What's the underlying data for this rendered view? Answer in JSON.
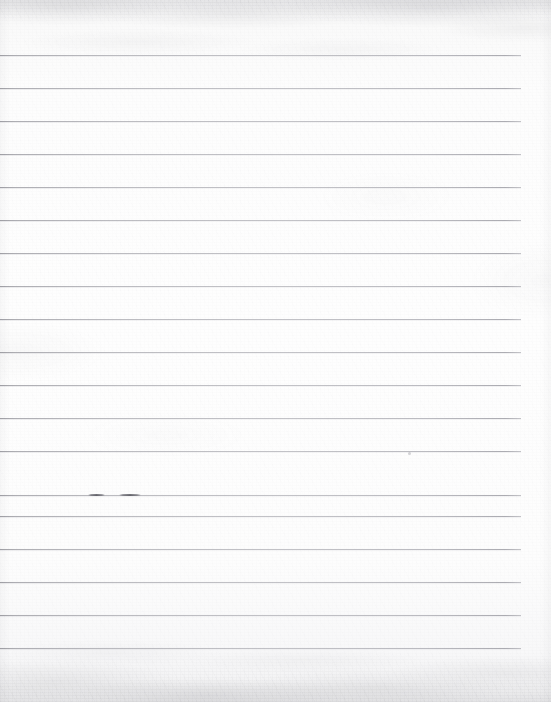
{
  "document": {
    "type": "scanned-ruled-notebook-page",
    "description": "Blank lined notebook paper, scanned",
    "content_text": "",
    "width": 551,
    "height": 702
  },
  "paper": {
    "background_color": "#fcfcfc",
    "edge_tint_color": "#f0f0f1",
    "texture": "scan-noise-mottled"
  },
  "ruling": {
    "line_color": "#a9a9ad",
    "line_thickness_px": 1,
    "line_spacing_px": 33,
    "first_line_y": 55,
    "line_start_x": 0,
    "line_end_x": 521,
    "right_margin_px": 30,
    "line_count": 19,
    "line_y_positions": [
      55,
      88,
      121,
      154,
      187,
      220,
      253,
      286,
      319,
      352,
      385,
      418,
      451,
      484,
      495,
      516,
      549,
      582,
      615,
      648
    ]
  },
  "rules": [
    {
      "y": 55,
      "x1": 0,
      "x2": 521
    },
    {
      "y": 88,
      "x1": 0,
      "x2": 521
    },
    {
      "y": 121,
      "x1": 0,
      "x2": 521
    },
    {
      "y": 154,
      "x1": 0,
      "x2": 521
    },
    {
      "y": 187,
      "x1": 0,
      "x2": 521
    },
    {
      "y": 220,
      "x1": 0,
      "x2": 521
    },
    {
      "y": 253,
      "x1": 0,
      "x2": 521
    },
    {
      "y": 286,
      "x1": 0,
      "x2": 521
    },
    {
      "y": 319,
      "x1": 0,
      "x2": 521
    },
    {
      "y": 352,
      "x1": 0,
      "x2": 521
    },
    {
      "y": 385,
      "x1": 0,
      "x2": 521
    },
    {
      "y": 418,
      "x1": 0,
      "x2": 521
    },
    {
      "y": 451,
      "x1": 0,
      "x2": 521
    },
    {
      "y": 495,
      "x1": 0,
      "x2": 521
    },
    {
      "y": 516,
      "x1": 0,
      "x2": 521
    },
    {
      "y": 549,
      "x1": 0,
      "x2": 521
    },
    {
      "y": 582,
      "x1": 0,
      "x2": 521
    },
    {
      "y": 615,
      "x1": 0,
      "x2": 521
    },
    {
      "y": 648,
      "x1": 0,
      "x2": 521
    }
  ],
  "marks": {
    "pencil_dashes": [
      {
        "x": 88,
        "y": 494,
        "width": 17,
        "color": "#55555d"
      },
      {
        "x": 119,
        "y": 494,
        "width": 22,
        "color": "#55555d"
      }
    ],
    "specks": [
      {
        "x": 408,
        "y": 452,
        "size": 3
      }
    ]
  }
}
